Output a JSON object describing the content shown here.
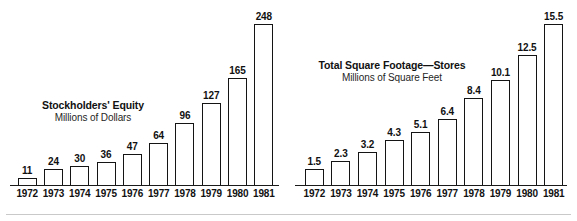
{
  "figure": {
    "background_color": "#ffffff",
    "ink_color": "#141414"
  },
  "charts": [
    {
      "id": "stockholders-equity",
      "title": "Stockholders' Equity",
      "subtitle": "Millions of Dollars"
    },
    {
      "id": "total-square-footage-stores",
      "title": "Total Square Footage—Stores",
      "subtitle": "Millions of Square Feet"
    }
  ],
  "chart_data": [
    {
      "type": "bar",
      "title": "Stockholders' Equity",
      "subtitle": "Millions of Dollars",
      "xlabel": "",
      "ylabel": "Millions of Dollars",
      "categories": [
        "1972",
        "1973",
        "1974",
        "1975",
        "1976",
        "1977",
        "1978",
        "1979",
        "1980",
        "1981"
      ],
      "values": [
        11,
        24,
        30,
        36,
        47,
        64,
        96,
        127,
        165,
        248
      ],
      "value_labels": [
        "11",
        "24",
        "30",
        "36",
        "47",
        "64",
        "96",
        "127",
        "165",
        "248"
      ],
      "ylim": [
        0,
        248
      ],
      "grid": false,
      "legend": false,
      "bar_style": "outlined"
    },
    {
      "type": "bar",
      "title": "Total Square Footage—Stores",
      "subtitle": "Millions of Square Feet",
      "xlabel": "",
      "ylabel": "Millions of Square Feet",
      "categories": [
        "1972",
        "1973",
        "1974",
        "1975",
        "1976",
        "1977",
        "1978",
        "1979",
        "1980",
        "1981"
      ],
      "values": [
        1.5,
        2.3,
        3.2,
        4.3,
        5.1,
        6.4,
        8.4,
        10.1,
        12.5,
        15.5
      ],
      "value_labels": [
        "1.5",
        "2.3",
        "3.2",
        "4.3",
        "5.1",
        "6.4",
        "8.4",
        "10.1",
        "12.5",
        "15.5"
      ],
      "ylim": [
        0,
        15.5
      ],
      "grid": false,
      "legend": false,
      "bar_style": "outlined"
    }
  ]
}
